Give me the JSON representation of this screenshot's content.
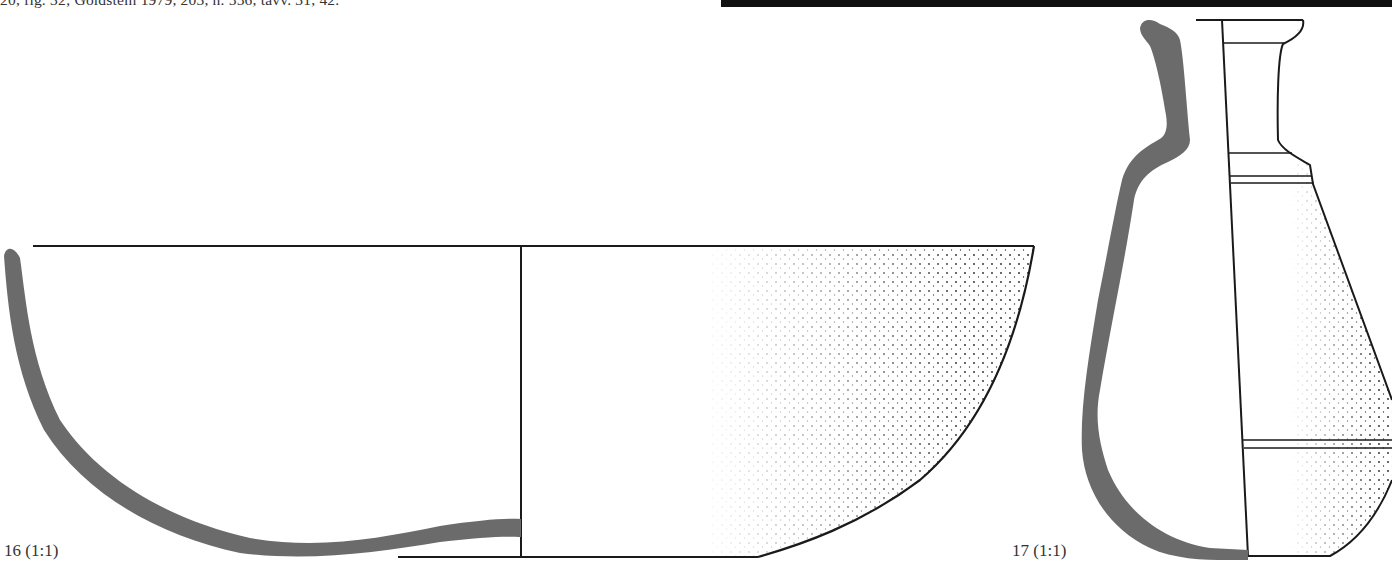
{
  "page": {
    "citation_text": "20, fig. 32; Goldstein 1979, 203, n. 556, tavv. 31, 42.",
    "header_bar_color": "#111111"
  },
  "figures": [
    {
      "number": "16",
      "label": "16 (1:1)",
      "scale": "1:1",
      "object": "bowl profile drawing",
      "section_color": "#6b6b6b",
      "line_color": "#1a1a1a"
    },
    {
      "number": "17",
      "label": "17 (1:1)",
      "scale": "1:1",
      "object": "flask/jug profile drawing",
      "section_color": "#6b6b6b",
      "line_color": "#1a1a1a"
    }
  ]
}
